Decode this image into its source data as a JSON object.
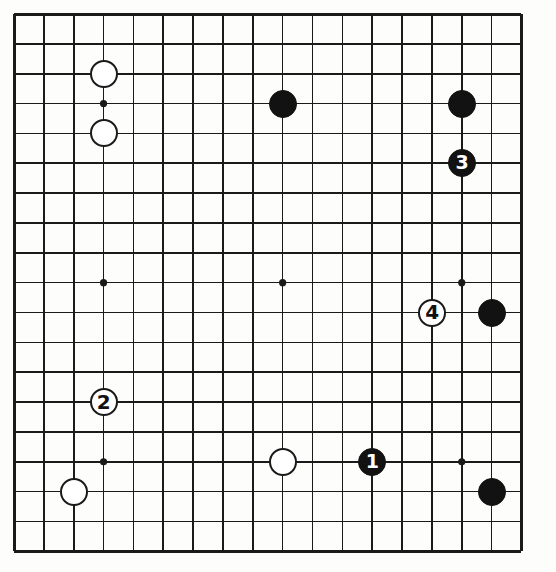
{
  "diagram": {
    "type": "go-board-diagram",
    "board": {
      "line_color": "#1a1a1a",
      "background_color": "#fdfdfb",
      "columns": 18,
      "rows": 19,
      "origin_x": 14,
      "origin_y": 14,
      "spacing": 29.85,
      "edge_line_width": 3,
      "inner_line_width": 1.6,
      "star_point_radius": 3.6,
      "star_point_columns": [
        3,
        9,
        15
      ],
      "star_point_rows": [
        3,
        9,
        15
      ],
      "stone_radius": 14
    },
    "colors": {
      "black_stone": "#121212",
      "white_stone": "#ffffff",
      "stone_outline": "#1a1a1a",
      "black_label_text": "#ffffff",
      "white_label_text": "#111111"
    },
    "stones": [
      {
        "id": "white-stone-c3-r2",
        "color": "white",
        "col": 3,
        "row": 2,
        "label": ""
      },
      {
        "id": "white-stone-c3-r4",
        "color": "white",
        "col": 3,
        "row": 4,
        "label": ""
      },
      {
        "id": "black-stone-c9-r3",
        "color": "black",
        "col": 9,
        "row": 3,
        "label": ""
      },
      {
        "id": "black-stone-c15-r3",
        "color": "black",
        "col": 15,
        "row": 3,
        "label": ""
      },
      {
        "id": "black-move-3",
        "color": "black",
        "col": 15,
        "row": 5,
        "label": "3"
      },
      {
        "id": "white-move-4",
        "color": "white",
        "col": 14,
        "row": 10,
        "label": "4"
      },
      {
        "id": "black-stone-c16-r10",
        "color": "black",
        "col": 16,
        "row": 10,
        "label": ""
      },
      {
        "id": "white-move-2",
        "color": "white",
        "col": 3,
        "row": 13,
        "label": "2"
      },
      {
        "id": "white-stone-c9-r15",
        "color": "white",
        "col": 9,
        "row": 15,
        "label": ""
      },
      {
        "id": "black-move-1",
        "color": "black",
        "col": 12,
        "row": 15,
        "label": "1"
      },
      {
        "id": "white-stone-c2-r16",
        "color": "white",
        "col": 2,
        "row": 16,
        "label": ""
      },
      {
        "id": "black-stone-c16-r16",
        "color": "black",
        "col": 16,
        "row": 16,
        "label": ""
      }
    ],
    "move_sequence": [
      {
        "number": "1",
        "color": "black"
      },
      {
        "number": "2",
        "color": "white"
      },
      {
        "number": "3",
        "color": "black"
      },
      {
        "number": "4",
        "color": "white"
      }
    ]
  }
}
